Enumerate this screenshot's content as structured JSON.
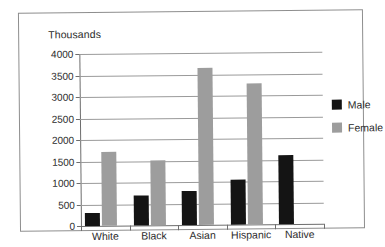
{
  "chart_data": {
    "type": "bar",
    "title": "",
    "subtitle": "",
    "axis_unit_label": "Thousands",
    "xlabel": "",
    "ylabel": "Thousands",
    "ylim": [
      0,
      4000
    ],
    "ytick_step": 500,
    "yticks": [
      "4000",
      "3500",
      "3000",
      "2500",
      "2000",
      "1500",
      "1000",
      "500",
      "0"
    ],
    "grid": true,
    "legend_position": "right",
    "categories": [
      "White",
      "Black",
      "Asian",
      "Hispanic",
      "Native"
    ],
    "series": [
      {
        "name": "Male",
        "color": "#141414",
        "values": [
          300,
          700,
          800,
          1050,
          1600
        ]
      },
      {
        "name": "Female",
        "color": "#9d9d9d",
        "values": [
          1720,
          1520,
          3650,
          3280,
          null
        ]
      }
    ]
  },
  "legend": {
    "items": [
      {
        "label": "Male",
        "swatch": "male"
      },
      {
        "label": "Female",
        "swatch": "female"
      }
    ]
  }
}
